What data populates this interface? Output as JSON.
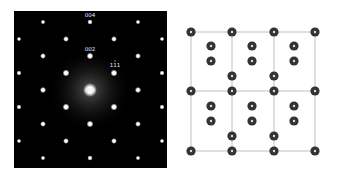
{
  "figure": {
    "left_panel": {
      "title": "electron diffraction pattern",
      "spot_labels": [
        {
          "text": "004",
          "col": 3,
          "row": 0
        },
        {
          "text": "002",
          "col": 3,
          "row": 2
        },
        {
          "text": "111",
          "col": 4,
          "row": 3,
          "overbar": true
        },
        {
          "text": "000",
          "col": 3,
          "row": 4
        }
      ],
      "colors": {
        "background": "#000000",
        "spot": "#ffffff"
      }
    },
    "right_panel": {
      "title": "crystal lattice projection",
      "cells_x": 3,
      "cells_y": 2,
      "colors": {
        "line": "#b0b0b0",
        "atom": "#333333",
        "atom_center": "#dddddd"
      }
    }
  }
}
